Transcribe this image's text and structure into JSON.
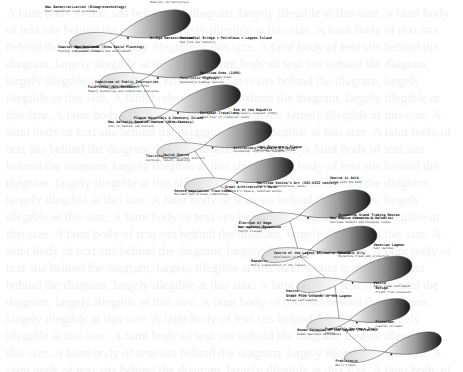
{
  "background_text": "A faint body of text sits behind the diagram, largely illegible at this size.",
  "diagram": {
    "type": "cascading-loops",
    "colors": {
      "loop_dark": "#1a1a1a",
      "loop_light": "#ffffff",
      "line": "#555555",
      "text": "#111111"
    },
    "loops": [
      {
        "id": 1,
        "labels": [
          {
            "title": "New Decentralization (Bioagrotechnology)",
            "sub": "Post-capitalist local economies"
          },
          {
            "title": "Coastal Agribusiness",
            "sub": "Fishing and coastal trade"
          },
          {
            "title": "Bridge Reconstruction?",
            "sub": ""
          },
          {
            "title": "Railway (1900s) + Highway + Tourism",
            "sub": "Mobility infrastructure"
          }
        ]
      },
      {
        "id": 2,
        "labels": [
          {
            "title": "New Attitude (Snow Basin Planning)",
            "sub": "Regional planning and development"
          },
          {
            "title": "Futuristic (Art Movement)",
            "sub": "Modern technology and industrial discourse"
          },
          {
            "title": "Futuristic Highways",
            "sub": "Automobile highway network"
          },
          {
            "title": "Monumental Bridge + Petroleum + Lagoon Island",
            "sub": "Sea link and industry"
          }
        ]
      },
      {
        "id": 3,
        "labels": [
          {
            "title": "Committee of Public Instruction",
            "sub": "Education and governance reforms"
          },
          {
            "title": "New Adriatic Sand of Venice (19th Century)",
            "sub": "City of fashion and tourism"
          },
          {
            "title": "European Travellers",
            "sub": "Grand Tour of classical ruins"
          },
          {
            "title": "Maritime Ones (1800)",
            "sub": "Lost maritime power"
          }
        ]
      },
      {
        "id": 4,
        "labels": [
          {
            "title": "Plague Hospitals & Cemetery Island",
            "sub": "Lazzaretto islands and quarantine"
          },
          {
            "title": "Tourists",
            "sub": "Carnival, luxury, gambling"
          },
          {
            "title": "Aristocracy, Arsenale & Piazza",
            "sub": "Ceremonial city of the Republic"
          },
          {
            "title": "End of the Republic",
            "sub": "Napoleonic conquest (1797)"
          }
        ]
      },
      {
        "id": 5,
        "labels": [
          {
            "title": "Jewish Ghetto",
            "sub": "Segregated urban district"
          },
          {
            "title": "Second population flourished",
            "sub": "Merchant and artisan communities"
          },
          {
            "title": "Maritime Venice's Art (XVI-XVII century)",
            "sub": "Painting, architecture, music"
          },
          {
            "title": "Lost Fortunes + Plague",
            "sub": "Decline of trade routes"
          }
        ]
      },
      {
        "id": 6,
        "labels": [
          {
            "title": "Great Architecture + Water",
            "sub": "St. Mark's Square, Venetian Gothic"
          },
          {
            "title": "War against Byzantium",
            "sub": "Fourth Crusade"
          },
          {
            "title": "New Empire (Venetic & Dalmatia)",
            "sub": "Overseas domains and shipping routes"
          },
          {
            "title": "Venice in Gold",
            "sub": "Trade with the East"
          }
        ]
      },
      {
        "id": 7,
        "labels": [
          {
            "title": "Election of Doge",
            "sub": "Emergence of statehood"
          },
          {
            "title": "Republic",
            "sub": "Early organization of the lagoon"
          },
          {
            "title": "Venice's Ally",
            "sub": "Byzantine trade and protection"
          },
          {
            "title": "Byzantine Grand Trading Routes",
            "sub": "Eastern Mediterranean"
          }
        ]
      },
      {
        "id": 8,
        "labels": [
          {
            "title": "Centre of the Lagoon (Rivoalto Islands)",
            "sub": "Settlement of Rialto"
          },
          {
            "title": "Venice",
            "sub": "Island fishers and salt makers"
          },
          {
            "title": "Venice",
            "sub": "Early trade settlement"
          },
          {
            "title": "Venetian Lagoon",
            "sub": "Salt marshes"
          }
        ]
      },
      {
        "id": 9,
        "labels": [
          {
            "title": "Great Five Islands in the Lagoon",
            "sub": "Refuge settlements"
          },
          {
            "title": "Roman Colonies of the Lagoon (Torcello)",
            "sub": "Roman mainland settlements"
          },
          {
            "title": "Fishermen",
            "sub": "Coastal villages"
          },
          {
            "title": "Refuge",
            "sub": "Flight from invasions"
          }
        ]
      },
      {
        "id": 10,
        "labels": [
          {
            "title": "Prehistoric Northern Italy",
            "sub": "Veneti"
          },
          {
            "title": "Prehistoric",
            "sub": "Early tribes"
          }
        ]
      }
    ]
  }
}
